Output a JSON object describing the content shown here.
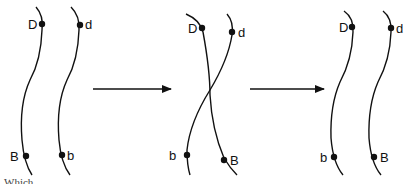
{
  "diagram": {
    "type": "chromosome-crossover",
    "stroke_color": "#111111",
    "panels": [
      {
        "id": "before",
        "chromosomes": [
          {
            "top_label": "D",
            "bottom_label": "B"
          },
          {
            "top_label": "d",
            "bottom_label": "b"
          }
        ]
      },
      {
        "id": "crossing-over",
        "chromosomes": [
          {
            "top_label": "D",
            "bottom_label": "B"
          },
          {
            "top_label": "d",
            "bottom_label": "b"
          }
        ]
      },
      {
        "id": "after",
        "chromosomes": [
          {
            "top_label": "D",
            "bottom_label": "b"
          },
          {
            "top_label": "d",
            "bottom_label": "B"
          }
        ]
      }
    ],
    "arrows": [
      {
        "from": "before",
        "to": "crossing-over"
      },
      {
        "from": "crossing-over",
        "to": "after"
      }
    ]
  },
  "labels": {
    "p1_D": "D",
    "p1_d": "d",
    "p1_B": "B",
    "p1_b": "b",
    "p2_D": "D",
    "p2_d": "d",
    "p2_B": "B",
    "p2_b": "b",
    "p3_D": "D",
    "p3_d": "d",
    "p3_b": "b",
    "p3_B": "B"
  },
  "footer_text": "Which..."
}
